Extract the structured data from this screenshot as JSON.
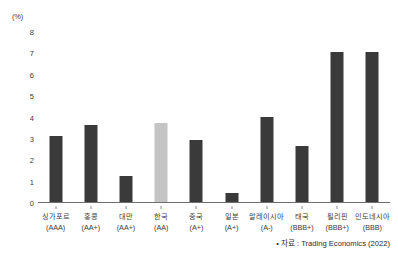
{
  "chart_data": {
    "type": "bar",
    "title": "",
    "subtitle": "",
    "xlabel": "",
    "ylabel": "(%)",
    "ylim": [
      0,
      8
    ],
    "ytick_labels": [
      "0",
      "1",
      "2",
      "3",
      "4",
      "5",
      "6",
      "7",
      "8"
    ],
    "grid": false,
    "legend": "none",
    "categories": [
      "싱가포르",
      "홍콩",
      "대만",
      "한국",
      "중국",
      "일본",
      "말레이시아",
      "태국",
      "필리핀",
      "인도네시아"
    ],
    "category_sublabels": [
      "(AAA)",
      "(AA+)",
      "(AA+)",
      "(AA)",
      "(A+)",
      "(A+)",
      "(A-)",
      "(BBB+)",
      "(BBB+)",
      "(BBB)"
    ],
    "values": [
      3.1,
      3.6,
      1.2,
      3.7,
      2.9,
      0.4,
      4.0,
      2.6,
      7.0,
      7.0
    ],
    "highlight_index": 3,
    "colors": {
      "bar": "#3a3a3a",
      "bar_highlight": "#c4c4c4",
      "axis": "#6e6e6e",
      "text": "#3b3b3b",
      "background": "#ffffff"
    }
  },
  "source": {
    "note": "• 자료 : Trading Economics (2022)"
  }
}
